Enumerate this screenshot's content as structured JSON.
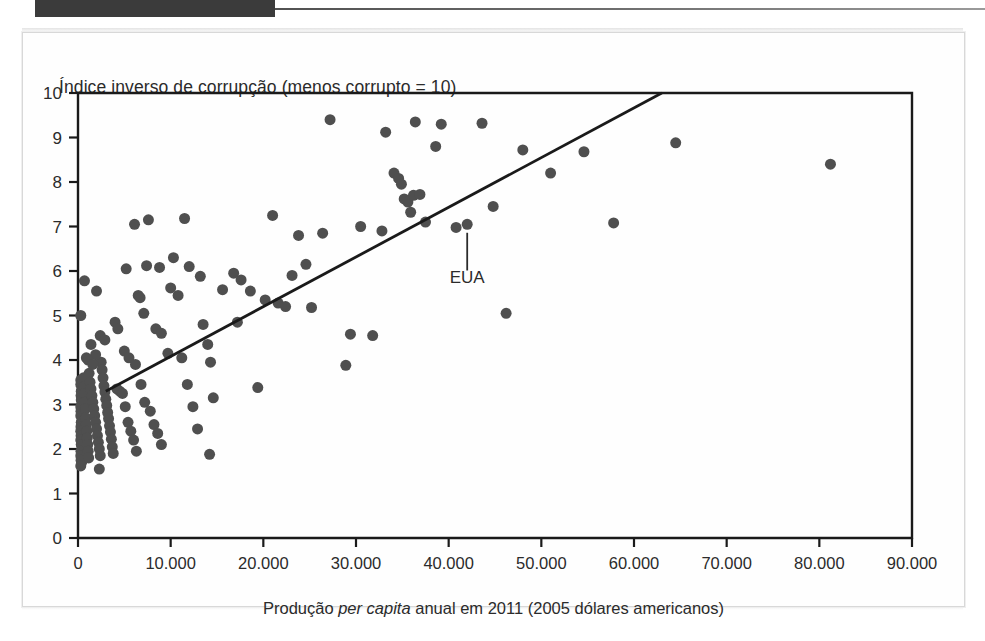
{
  "page": {
    "background_color": "#ffffff",
    "card_border_color": "#d8d8d8",
    "top_tab_color": "#3b3b3b"
  },
  "chart_data": {
    "type": "scatter",
    "title": "",
    "ylabel": "Índice inverso de corrupção (menos corrupto = 10)",
    "xlabel_parts": {
      "before": "Produção ",
      "italic": "per capita",
      "after": " anual em 2011 (2005 dólares americanos)"
    },
    "xlabel": "Produção per capita anual em 2011 (2005 dólares americanos)",
    "xlim": [
      0,
      90000
    ],
    "ylim": [
      0,
      10
    ],
    "xticks": [
      0,
      10000,
      20000,
      30000,
      40000,
      50000,
      60000,
      70000,
      80000,
      90000
    ],
    "xtick_labels": [
      "0",
      "10.000",
      "20.000",
      "30.000",
      "40.000",
      "50.000",
      "60.000",
      "70.000",
      "80.000",
      "90.000"
    ],
    "yticks": [
      0,
      1,
      2,
      3,
      4,
      5,
      6,
      7,
      8,
      9,
      10
    ],
    "ytick_labels": [
      "0",
      "1",
      "2",
      "3",
      "4",
      "5",
      "6",
      "7",
      "8",
      "9",
      "10"
    ],
    "grid": false,
    "legend": null,
    "marker_color": "#4f4f4f",
    "marker_size_px": 11,
    "line_color": "#1a1a1a",
    "trendline": {
      "x0": 3000,
      "y0": 3.3,
      "x1": 63000,
      "y1": 10.0,
      "label": "linha de tendência"
    },
    "annotations": [
      {
        "text": "EUA",
        "point_x": 42000,
        "point_y": 7.05,
        "label_x": 42000,
        "label_y": 5.72
      }
    ],
    "points": [
      [
        300,
        5.0
      ],
      [
        700,
        5.78
      ],
      [
        2000,
        5.55
      ],
      [
        2300,
        1.55
      ],
      [
        400,
        1.7
      ],
      [
        300,
        3.55
      ],
      [
        300,
        3.45
      ],
      [
        350,
        3.3
      ],
      [
        330,
        3.2
      ],
      [
        350,
        3.1
      ],
      [
        300,
        2.95
      ],
      [
        320,
        2.85
      ],
      [
        300,
        2.75
      ],
      [
        350,
        2.6
      ],
      [
        320,
        2.5
      ],
      [
        300,
        2.4
      ],
      [
        330,
        2.3
      ],
      [
        300,
        2.2
      ],
      [
        350,
        2.1
      ],
      [
        320,
        1.95
      ],
      [
        300,
        1.85
      ],
      [
        330,
        1.75
      ],
      [
        300,
        1.62
      ],
      [
        600,
        3.6
      ],
      [
        650,
        3.4
      ],
      [
        700,
        3.25
      ],
      [
        750,
        3.05
      ],
      [
        800,
        2.9
      ],
      [
        850,
        2.7
      ],
      [
        900,
        2.55
      ],
      [
        950,
        2.4
      ],
      [
        1000,
        2.25
      ],
      [
        1050,
        2.1
      ],
      [
        1100,
        1.95
      ],
      [
        1150,
        1.8
      ],
      [
        1200,
        3.7
      ],
      [
        1300,
        3.5
      ],
      [
        1400,
        3.35
      ],
      [
        1500,
        3.2
      ],
      [
        1600,
        3.05
      ],
      [
        1700,
        2.9
      ],
      [
        1800,
        2.75
      ],
      [
        1900,
        2.6
      ],
      [
        2000,
        2.45
      ],
      [
        2100,
        2.3
      ],
      [
        2200,
        2.15
      ],
      [
        2300,
        2.0
      ],
      [
        2400,
        1.85
      ],
      [
        2500,
        3.95
      ],
      [
        2600,
        3.78
      ],
      [
        2700,
        3.6
      ],
      [
        2800,
        3.42
      ],
      [
        2900,
        3.28
      ],
      [
        3000,
        3.12
      ],
      [
        3100,
        2.98
      ],
      [
        3200,
        2.82
      ],
      [
        3300,
        2.68
      ],
      [
        3400,
        2.52
      ],
      [
        3500,
        2.38
      ],
      [
        3600,
        2.22
      ],
      [
        3700,
        2.05
      ],
      [
        3800,
        1.9
      ],
      [
        900,
        4.05
      ],
      [
        1400,
        4.35
      ],
      [
        1900,
        4.12
      ],
      [
        2400,
        4.55
      ],
      [
        2900,
        4.45
      ],
      [
        1100,
        4.0
      ],
      [
        1600,
        3.9
      ],
      [
        4200,
        3.35
      ],
      [
        4500,
        3.3
      ],
      [
        4800,
        3.25
      ],
      [
        5100,
        2.95
      ],
      [
        5400,
        2.6
      ],
      [
        5700,
        2.4
      ],
      [
        6000,
        2.2
      ],
      [
        6300,
        1.95
      ],
      [
        4000,
        4.85
      ],
      [
        4300,
        4.7
      ],
      [
        5000,
        4.2
      ],
      [
        5500,
        4.05
      ],
      [
        6200,
        3.9
      ],
      [
        6800,
        3.45
      ],
      [
        7200,
        3.05
      ],
      [
        7800,
        2.85
      ],
      [
        8200,
        2.55
      ],
      [
        8600,
        2.35
      ],
      [
        9000,
        2.1
      ],
      [
        5200,
        6.05
      ],
      [
        6100,
        7.05
      ],
      [
        6500,
        5.45
      ],
      [
        7100,
        5.05
      ],
      [
        7600,
        7.15
      ],
      [
        8400,
        4.7
      ],
      [
        9000,
        4.6
      ],
      [
        9700,
        4.15
      ],
      [
        10300,
        6.3
      ],
      [
        10800,
        5.45
      ],
      [
        11200,
        4.05
      ],
      [
        11800,
        3.45
      ],
      [
        12400,
        2.95
      ],
      [
        12900,
        2.45
      ],
      [
        13500,
        4.8
      ],
      [
        14000,
        4.35
      ],
      [
        14300,
        3.95
      ],
      [
        14600,
        3.15
      ],
      [
        14200,
        1.88
      ],
      [
        15600,
        5.58
      ],
      [
        16800,
        5.95
      ],
      [
        17600,
        5.8
      ],
      [
        18600,
        5.55
      ],
      [
        19400,
        3.38
      ],
      [
        20200,
        5.35
      ],
      [
        21000,
        7.25
      ],
      [
        21600,
        5.28
      ],
      [
        22400,
        5.2
      ],
      [
        23800,
        6.8
      ],
      [
        24600,
        6.15
      ],
      [
        25200,
        5.18
      ],
      [
        27200,
        9.4
      ],
      [
        28900,
        3.88
      ],
      [
        29400,
        4.58
      ],
      [
        31800,
        4.55
      ],
      [
        33200,
        9.12
      ],
      [
        34100,
        8.2
      ],
      [
        34600,
        8.08
      ],
      [
        34900,
        7.95
      ],
      [
        35200,
        7.62
      ],
      [
        35600,
        7.55
      ],
      [
        35900,
        7.32
      ],
      [
        36400,
        9.35
      ],
      [
        36200,
        7.7
      ],
      [
        36900,
        7.72
      ],
      [
        37500,
        7.1
      ],
      [
        38600,
        8.8
      ],
      [
        39200,
        9.3
      ],
      [
        40800,
        6.98
      ],
      [
        42000,
        7.05
      ],
      [
        43600,
        9.32
      ],
      [
        44800,
        7.45
      ],
      [
        46200,
        5.05
      ],
      [
        48000,
        8.72
      ],
      [
        51000,
        8.2
      ],
      [
        54600,
        8.68
      ],
      [
        57800,
        7.08
      ],
      [
        64500,
        8.88
      ],
      [
        81200,
        8.4
      ],
      [
        30500,
        7.0
      ],
      [
        32800,
        6.9
      ],
      [
        26400,
        6.85
      ],
      [
        23100,
        5.9
      ],
      [
        17200,
        4.85
      ],
      [
        13200,
        5.88
      ],
      [
        12000,
        6.1
      ],
      [
        10000,
        5.62
      ],
      [
        8800,
        6.08
      ],
      [
        7400,
        6.12
      ],
      [
        6700,
        5.4
      ],
      [
        11500,
        7.18
      ]
    ]
  },
  "axes_geometry": {
    "left_px": 77,
    "right_px": 911,
    "top_px": 92,
    "bottom_px": 537
  }
}
